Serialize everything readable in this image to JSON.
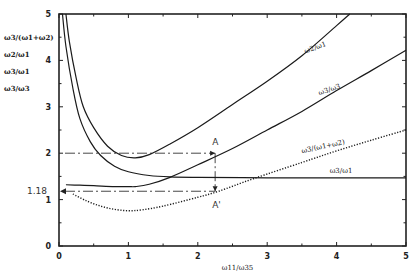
{
  "chart_data": {
    "type": "line",
    "title": "",
    "xlabel": "ω11/ω35",
    "ylabel_stack": [
      "ω3/(ω1+ω2)",
      "ω2/ω1",
      "ω3/ω1",
      "ω3/ω3"
    ],
    "xlim": [
      0,
      5
    ],
    "ylim": [
      0,
      5
    ],
    "x_ticks": [
      0,
      1,
      2,
      3,
      4,
      5
    ],
    "x_tick_labels": [
      "0",
      "1",
      "2",
      "3",
      "4",
      "5"
    ],
    "y_ticks": [
      0,
      1,
      2,
      3,
      4,
      5
    ],
    "y_tick_labels": [
      "0",
      "1",
      "2",
      "3",
      "4",
      "5"
    ],
    "grid": false,
    "series": [
      {
        "name": "ω2/ω1",
        "label": "ω2/ω1",
        "style": "solid",
        "x": [
          0.1,
          0.15,
          0.25,
          0.35,
          0.5,
          0.7,
          0.9,
          1.1,
          1.3,
          1.6,
          2.0,
          2.5,
          3.0,
          3.5,
          4.0,
          4.19
        ],
        "y": [
          5.0,
          4.4,
          3.6,
          3.0,
          2.55,
          2.15,
          1.95,
          1.9,
          1.97,
          2.2,
          2.55,
          3.05,
          3.55,
          4.1,
          4.75,
          5.0
        ]
      },
      {
        "name": "ω3/ω1 (rising)",
        "label": "ω3/ω3",
        "style": "solid",
        "x": [
          0.1,
          0.3,
          0.5,
          0.8,
          1.0,
          1.1,
          1.3,
          1.6,
          2.0,
          2.5,
          3.0,
          3.5,
          4.0,
          4.5,
          5.0
        ],
        "y": [
          1.32,
          1.31,
          1.3,
          1.28,
          1.28,
          1.28,
          1.33,
          1.48,
          1.75,
          2.1,
          2.5,
          2.9,
          3.35,
          3.78,
          4.22
        ]
      },
      {
        "name": "ω3/ω1 (decaying)",
        "label": "ω3/ω1",
        "style": "solid",
        "x": [
          0.05,
          0.1,
          0.2,
          0.3,
          0.45,
          0.6,
          0.8,
          1.0,
          1.3,
          1.6,
          2.0,
          3.0,
          4.0,
          5.0
        ],
        "y": [
          5.0,
          4.3,
          3.4,
          2.75,
          2.25,
          1.95,
          1.72,
          1.6,
          1.52,
          1.49,
          1.48,
          1.47,
          1.47,
          1.47
        ]
      },
      {
        "name": "ω3/(ω1+ω2)",
        "label": "ω3/(ω1+ω2)",
        "style": "dotted",
        "x": [
          0.2,
          0.4,
          0.6,
          0.8,
          1.0,
          1.2,
          1.5,
          2.0,
          2.3,
          2.8,
          3.5,
          4.0,
          4.5,
          5.0
        ],
        "y": [
          1.12,
          0.97,
          0.86,
          0.79,
          0.76,
          0.78,
          0.86,
          1.05,
          1.18,
          1.45,
          1.8,
          2.05,
          2.28,
          2.5
        ]
      }
    ],
    "annotations": [
      {
        "label": "A",
        "x": 2.25,
        "y": 2.0
      },
      {
        "label": "A'",
        "x": 2.25,
        "y": 1.18
      },
      {
        "label": "1.18",
        "axis": "y",
        "value": 1.18
      }
    ],
    "reference_lines": [
      {
        "type": "horizontal",
        "y": 2.0,
        "x_range": [
          0,
          2.25
        ],
        "style": "dash-dot"
      },
      {
        "type": "horizontal",
        "y": 1.18,
        "x_range": [
          0,
          2.25
        ],
        "style": "dash-dot"
      },
      {
        "type": "vertical",
        "x": 2.25,
        "y_range": [
          1.18,
          2.0
        ],
        "style": "dash-dot"
      }
    ]
  }
}
